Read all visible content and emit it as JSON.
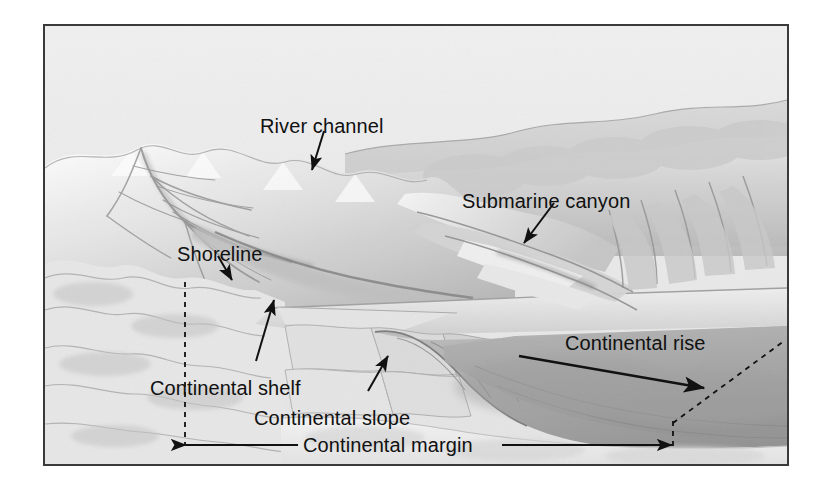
{
  "figure": {
    "kind": "block-diagram",
    "frame": {
      "border_color": "#3a3a3a",
      "background": "#e9e9e9"
    },
    "palette": {
      "ink": "#111111",
      "land_light": "#f2f2f2",
      "land_mid": "#cfcfcf",
      "land_dark": "#8f8f8f",
      "ocean_floor": "#a8a8a8",
      "ocean_floor_dark": "#8a8a8a",
      "shelf": "#dddddd",
      "sky": "#ececec",
      "abyssal_plain": "#efefef"
    }
  },
  "labels": [
    {
      "id": "river-channel",
      "text": "River channel",
      "x": 258,
      "y": 100
    },
    {
      "id": "submarine-canyon",
      "text": "Submarine canyon",
      "x": 460,
      "y": 175
    },
    {
      "id": "shoreline",
      "text": "Shoreline",
      "x": 175,
      "y": 228
    },
    {
      "id": "continental-rise",
      "text": "Continental rise",
      "x": 563,
      "y": 317
    },
    {
      "id": "continental-shelf",
      "text": "Continental shelf",
      "x": 148,
      "y": 362
    },
    {
      "id": "continental-slope",
      "text": "Continental slope",
      "x": 252,
      "y": 392
    },
    {
      "id": "continental-margin",
      "text": "Continental margin",
      "x": 301,
      "y": 431
    }
  ],
  "leader_lines": [
    {
      "id": "river-channel-arrow",
      "from": [
        322,
        128
      ],
      "to": [
        310,
        167
      ]
    },
    {
      "id": "submarine-canyon-arrow",
      "from": [
        552,
        200
      ],
      "to": [
        522,
        240
      ]
    },
    {
      "id": "shoreline-arrow",
      "from": [
        216,
        253
      ],
      "to": [
        230,
        277
      ]
    },
    {
      "id": "continental-shelf-arrow",
      "from": [
        254,
        358
      ],
      "to": [
        272,
        297
      ]
    },
    {
      "id": "continental-slope-arrow",
      "from": [
        366,
        388
      ],
      "to": [
        386,
        353
      ]
    },
    {
      "id": "continental-rise-arrow",
      "from": [
        517,
        353
      ],
      "to": [
        702,
        385
      ]
    }
  ],
  "dimension": {
    "id": "continental-margin-extent",
    "label": "Continental margin",
    "y": 442,
    "x_start": 183,
    "x_end": 672,
    "gap_start": 296,
    "gap_end": 500
  },
  "guide_lines": [
    {
      "id": "left-margin-guide",
      "style": "dashed",
      "from": [
        183,
        280
      ],
      "to": [
        183,
        443
      ]
    },
    {
      "id": "right-margin-guide",
      "style": "dashed",
      "from": [
        671,
        443
      ],
      "to": [
        671,
        418
      ]
    },
    {
      "id": "rise-edge-guide",
      "style": "dashed",
      "from": [
        671,
        420
      ],
      "to": [
        782,
        338
      ]
    }
  ]
}
